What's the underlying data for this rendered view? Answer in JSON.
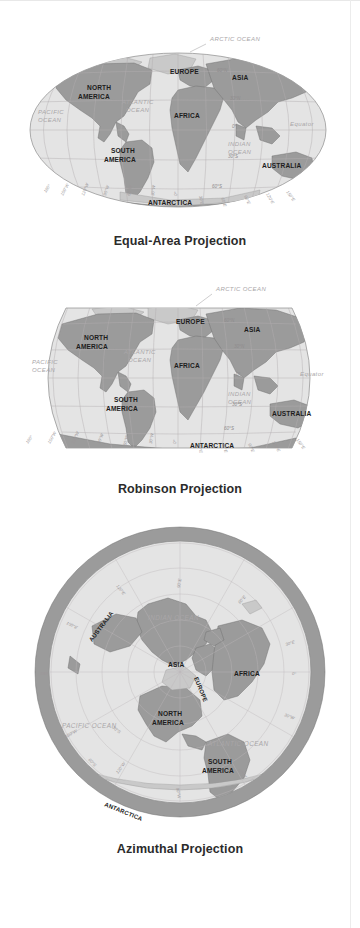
{
  "figure": {
    "title_visible": false,
    "panel_count": 3,
    "colors": {
      "land": "#9b9b9b",
      "land_light": "#c9c9c9",
      "ocean": "#e4e4e4",
      "graticule": "#b2aeb0",
      "label_dark": "#1d1d1d",
      "label_gray": "#a9a6a8",
      "background": "#ffffff"
    }
  },
  "panels": [
    {
      "id": "equal-area",
      "caption": "Equal-Area Projection",
      "shape": "ellipse",
      "continents": [
        {
          "name": "NORTH\nAMERICA",
          "line1": "NORTH",
          "line2": "AMERICA"
        },
        {
          "name": "SOUTH\nAMERICA",
          "line1": "SOUTH",
          "line2": "AMERICA"
        },
        {
          "name": "EUROPE"
        },
        {
          "name": "ASIA"
        },
        {
          "name": "AFRICA"
        },
        {
          "name": "AUSTRALIA"
        },
        {
          "name": "ANTARCTICA"
        }
      ],
      "oceans": [
        "ARCTIC OCEAN",
        "PACIFIC\nOCEAN",
        "ATLANTIC\nOCEAN",
        "INDIAN\nOCEAN"
      ],
      "ocean_labels": {
        "arctic": "ARCTIC OCEAN",
        "pacific_l1": "PACIFIC",
        "pacific_l2": "OCEAN",
        "atlantic_l1": "ATLANTIC",
        "atlantic_l2": "OCEAN",
        "indian_l1": "INDIAN",
        "indian_l2": "OCEAN"
      },
      "equator_label": "Equator",
      "latitudes": [
        "60°N",
        "30°N",
        "0°",
        "30°S",
        "60°S"
      ],
      "longitudes": [
        "180°",
        "150°W",
        "120°W",
        "90°W",
        "60°W",
        "30°W",
        "0°",
        "30°E",
        "60°E",
        "90°E",
        "120°E",
        "150°E"
      ]
    },
    {
      "id": "robinson",
      "caption": "Robinson Projection",
      "shape": "rounded-rectangle",
      "continents": [
        {
          "name": "NORTH\nAMERICA",
          "line1": "NORTH",
          "line2": "AMERICA"
        },
        {
          "name": "SOUTH\nAMERICA",
          "line1": "SOUTH",
          "line2": "AMERICA"
        },
        {
          "name": "EUROPE"
        },
        {
          "name": "ASIA"
        },
        {
          "name": "AFRICA"
        },
        {
          "name": "AUSTRALIA"
        },
        {
          "name": "ANTARCTICA"
        }
      ],
      "ocean_labels": {
        "arctic": "ARCTIC OCEAN",
        "pacific_l1": "PACIFIC",
        "pacific_l2": "OCEAN",
        "atlantic_l1": "ATLANTIC",
        "atlantic_l2": "OCEAN",
        "indian_l1": "INDIAN",
        "indian_l2": "OCEAN"
      },
      "equator_label": "Equator",
      "latitudes": [
        "60°N",
        "30°N",
        "0°",
        "30°S",
        "60°S"
      ],
      "longitudes": [
        "180°",
        "150°W",
        "120°W",
        "90°W",
        "60°W",
        "30°W",
        "0°",
        "30°E",
        "60°E",
        "90°E",
        "120°E",
        "150°E"
      ]
    },
    {
      "id": "azimuthal",
      "caption": "Azimuthal Projection",
      "shape": "circle",
      "continents": [
        {
          "name": "NORTH\nAMERICA",
          "line1": "NORTH",
          "line2": "AMERICA"
        },
        {
          "name": "SOUTH\nAMERICA",
          "line1": "SOUTH",
          "line2": "AMERICA"
        },
        {
          "name": "EUROPE"
        },
        {
          "name": "ASIA"
        },
        {
          "name": "AFRICA"
        },
        {
          "name": "AUSTRALIA"
        },
        {
          "name": "ANTARCTICA"
        }
      ],
      "ocean_labels": {
        "indian": "INDIAN OCEAN",
        "pacific": "PACIFIC OCEAN",
        "atlantic": "ATLANTIC OCEAN"
      },
      "latitudes": [
        "30°S",
        "60°S"
      ],
      "longitudes": [
        "0°",
        "30°E",
        "60°E",
        "90°E",
        "150°E",
        "180°",
        "150°W",
        "120°W",
        "30°W",
        "30°E"
      ]
    }
  ],
  "labels": {
    "arctic_ocean": "ARCTIC OCEAN",
    "pacific_ocean": "PACIFIC OCEAN",
    "atlantic_ocean": "ATLANTIC OCEAN",
    "indian_ocean": "INDIAN OCEAN",
    "equator": "Equator",
    "north": "NORTH",
    "south": "SOUTH",
    "america": "AMERICA",
    "europe": "EUROPE",
    "asia": "ASIA",
    "africa": "AFRICA",
    "australia": "AUSTRALIA",
    "antarctica": "ANTARCTICA",
    "pacific": "PACIFIC",
    "atlantic": "ATLANTIC",
    "indian": "INDIAN",
    "ocean": "OCEAN",
    "lat_60n": "60°N",
    "lat_30n": "30°N",
    "lat_0": "0°",
    "lat_30s": "30°S",
    "lat_60s": "60°S",
    "lon_180": "180°",
    "lon_150w": "150°W",
    "lon_120w": "120°W",
    "lon_90w": "90°W",
    "lon_60w": "60°W",
    "lon_30w": "30°W",
    "lon_0": "0°",
    "lon_30e": "30°E",
    "lon_60e": "60°E",
    "lon_90e": "90°E",
    "lon_120e": "120°E",
    "lon_150e": "150°E"
  }
}
